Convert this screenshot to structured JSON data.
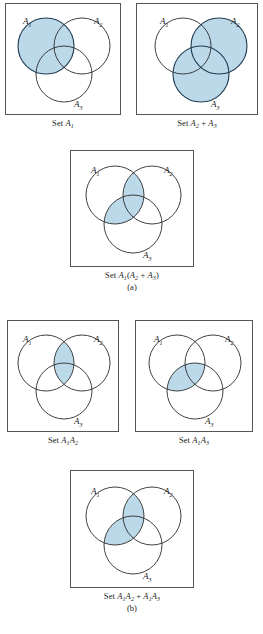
{
  "figure": {
    "type": "venn-diagram-set",
    "fill_color": "#bcd9ea",
    "stroke_color": "#2b2b2b",
    "box_border_color": "#555555",
    "circle_labels": {
      "a1": "A",
      "a1_sub": "1",
      "a2": "A",
      "a2_sub": "2",
      "a3": "A",
      "a3_sub": "3"
    }
  },
  "panels": [
    {
      "id": "set-a1",
      "caption_prefix": "Set ",
      "caption_main": "A",
      "caption_sub": "1",
      "caption_full": "Set A1",
      "shaded": [
        "A1"
      ],
      "circle_labels": [
        "A1",
        "A2",
        "A3"
      ]
    },
    {
      "id": "set-a2-plus-a3",
      "caption_prefix": "Set ",
      "caption_full": "Set A2 + A3",
      "shaded": [
        "A2",
        "A3"
      ],
      "circle_labels": [
        "A1",
        "A2",
        "A3"
      ]
    },
    {
      "id": "set-a1-times-a2-plus-a3",
      "caption_full": "Set A1(A2 + A3)",
      "shaded": [
        "A1A2",
        "A1A3"
      ],
      "circle_labels": [
        "A1",
        "A2",
        "A3"
      ]
    },
    {
      "id": "set-a1a2",
      "caption_full": "Set A1A2",
      "shaded": [
        "A1A2"
      ],
      "circle_labels": [
        "A1",
        "A2",
        "A3"
      ]
    },
    {
      "id": "set-a1a3",
      "caption_full": "Set A1A3",
      "shaded": [
        "A1A3"
      ],
      "circle_labels": [
        "A1",
        "A2",
        "A3"
      ]
    },
    {
      "id": "set-a1a2-plus-a1a3",
      "caption_full": "Set A1A2 + A1A3",
      "shaded": [
        "A1A2",
        "A1A3"
      ],
      "circle_labels": [
        "A1",
        "A2",
        "A3"
      ]
    }
  ],
  "subfigure_labels": {
    "a": "(a)",
    "b": "(b)"
  },
  "captions": {
    "p1": {
      "set": "Set ",
      "a": "A",
      "a_sub": "1"
    },
    "p2": {
      "set": "Set ",
      "a": "A",
      "a_sub": "2",
      "plus": " + ",
      "b": "A",
      "b_sub": "3"
    },
    "p3": {
      "set": "Set ",
      "a": "A",
      "a_sub": "1",
      "open": "(",
      "b": "A",
      "b_sub": "2",
      "plus": " + ",
      "c": "A",
      "c_sub": "3",
      "close": ")"
    },
    "p4": {
      "set": "Set ",
      "a": "A",
      "a_sub": "1",
      "b": "A",
      "b_sub": "2"
    },
    "p5": {
      "set": "Set ",
      "a": "A",
      "a_sub": "1",
      "b": "A",
      "b_sub": "3"
    },
    "p6": {
      "set": "Set ",
      "a": "A",
      "a_sub": "1",
      "b": "A",
      "b_sub": "2",
      "plus": " + ",
      "c": "A",
      "c_sub": "1",
      "d": "A",
      "d_sub": "3"
    }
  }
}
